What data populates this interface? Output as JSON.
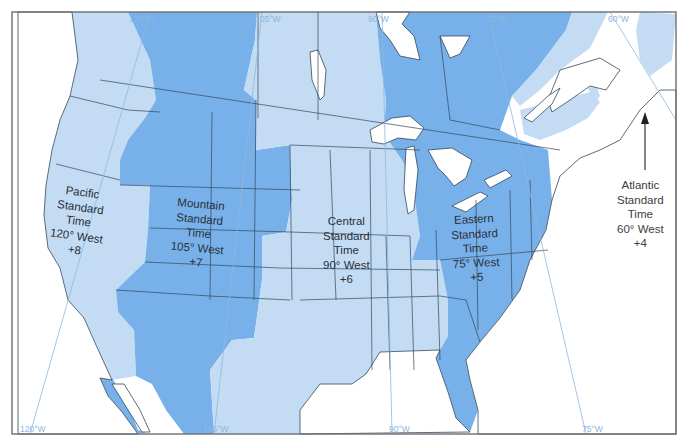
{
  "map": {
    "title": "North American Standard Time Zones",
    "colors": {
      "zone_light": "#c3dcf4",
      "zone_dark": "#78b1ea",
      "water": "#ffffff",
      "meridian": "#8fb8de",
      "frame": "#6b6e73"
    },
    "meridians": {
      "top": [
        {
          "label": "120°W"
        },
        {
          "label": "105°W"
        },
        {
          "label": "90°W"
        },
        {
          "label": "75°W"
        },
        {
          "label": "60°W"
        }
      ],
      "bottom": [
        {
          "label": "120°W"
        },
        {
          "label": "105°W"
        },
        {
          "label": "90°W"
        },
        {
          "label": "75°W"
        }
      ]
    },
    "zones": [
      {
        "name": "Pacific",
        "line1": "Pacific",
        "line2": "Standard",
        "line3": "Time",
        "line4": "120° West",
        "offset": "+8",
        "shade": "light"
      },
      {
        "name": "Mountain",
        "line1": "Mountain",
        "line2": "Standard",
        "line3": "Time",
        "line4": "105° West",
        "offset": "+7",
        "shade": "dark"
      },
      {
        "name": "Central",
        "line1": "Central",
        "line2": "Standard",
        "line3": "Time",
        "line4": "90° West",
        "offset": "+6",
        "shade": "light"
      },
      {
        "name": "Eastern",
        "line1": "Eastern",
        "line2": "Standard",
        "line3": "Time",
        "line4": "75° West",
        "offset": "+5",
        "shade": "dark"
      },
      {
        "name": "Atlantic",
        "line1": "Atlantic",
        "line2": "Standard",
        "line3": "Time",
        "line4": "60° West",
        "offset": "+4",
        "shade": "light"
      }
    ]
  }
}
